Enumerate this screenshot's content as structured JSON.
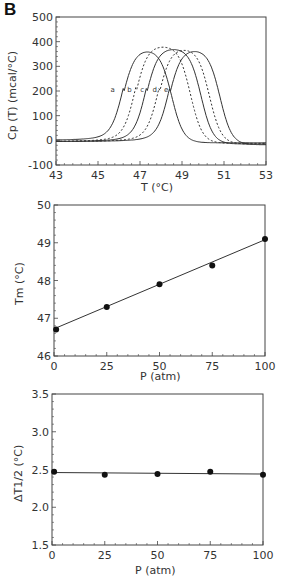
{
  "figure": {
    "panel_letter": "B"
  },
  "chart_data": [
    {
      "type": "line",
      "id": "cp-curves",
      "title": "",
      "xlabel": "T   (°C)",
      "ylabel": "Cp (T)   (mcal/°C)",
      "xlim": [
        43,
        53
      ],
      "ylim": [
        -100,
        500
      ],
      "xticks": [
        43,
        45,
        47,
        49,
        51,
        53
      ],
      "yticks": [
        -100,
        0,
        100,
        200,
        300,
        400,
        500
      ],
      "grid": false,
      "legend": "inline labels a–e near curves",
      "series": [
        {
          "name": "a",
          "style": "solid",
          "rise": 46.2,
          "fall": 48.5,
          "peak": 370,
          "baseline_left": 0,
          "baseline_right": -10,
          "label_x": 45.7
        },
        {
          "name": "b",
          "style": "dashed",
          "rise": 46.8,
          "fall": 49.4,
          "peak": 385,
          "baseline_left": -5,
          "baseline_right": -12,
          "label_x": 46.5
        },
        {
          "name": "c",
          "style": "solid",
          "rise": 47.3,
          "fall": 49.9,
          "peak": 375,
          "baseline_left": -5,
          "baseline_right": -15,
          "label_x": 47.1
        },
        {
          "name": "d",
          "style": "dashed",
          "rise": 47.9,
          "fall": 50.3,
          "peak": 375,
          "baseline_left": -5,
          "baseline_right": -15,
          "label_x": 47.7
        },
        {
          "name": "e",
          "style": "solid",
          "rise": 48.4,
          "fall": 50.8,
          "peak": 370,
          "baseline_left": -5,
          "baseline_right": -18,
          "label_x": 48.25
        }
      ]
    },
    {
      "type": "scatter",
      "id": "tm-vs-p",
      "title": "",
      "xlabel": "P   (atm)",
      "ylabel": "Tm   (°C)",
      "xlim": [
        0,
        100
      ],
      "ylim": [
        46,
        50
      ],
      "xticks": [
        0,
        25,
        50,
        75,
        100
      ],
      "yticks": [
        46,
        47,
        48,
        49,
        50
      ],
      "grid": false,
      "x": [
        1,
        25,
        50,
        75,
        100
      ],
      "values": [
        46.7,
        47.3,
        47.9,
        48.4,
        49.1
      ],
      "fit_line": {
        "x": [
          0,
          100
        ],
        "y": [
          46.72,
          49.08
        ]
      }
    },
    {
      "type": "scatter",
      "id": "dt-half-vs-p",
      "title": "",
      "xlabel": "P   (atm)",
      "ylabel": "ΔT1/2   (°C)",
      "xlim": [
        0,
        100
      ],
      "ylim": [
        1.5,
        3.5
      ],
      "xticks": [
        0,
        25,
        50,
        75,
        100
      ],
      "yticks": [
        1.5,
        2.0,
        2.5,
        3.0,
        3.5
      ],
      "ytick_labels": [
        "1.5",
        "2.0",
        "2.5",
        "3.0",
        "3.5"
      ],
      "grid": false,
      "x": [
        1,
        25,
        50,
        75,
        100
      ],
      "values": [
        2.47,
        2.43,
        2.44,
        2.47,
        2.43
      ],
      "fit_line": {
        "x": [
          0,
          100
        ],
        "y": [
          2.46,
          2.44
        ]
      }
    }
  ]
}
